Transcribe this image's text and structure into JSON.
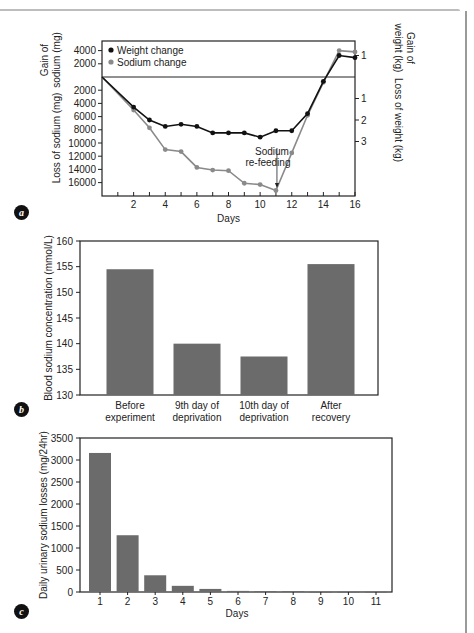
{
  "chart_data": [
    {
      "id": "a",
      "type": "line",
      "panel_label": "a",
      "title": "",
      "xlabel": "Days",
      "x_ticks": [
        2,
        4,
        6,
        8,
        10,
        12,
        14,
        16
      ],
      "xlim": [
        0,
        16
      ],
      "ylabel_left_top": "Gain of sodium (mg)",
      "ylabel_left_bottom": "Loss of sodium (mg)",
      "ylabel_right_top": "Gain of weight (kg)",
      "ylabel_right_bottom": "Loss of weight (kg)",
      "left_ticks_gain": [
        4000,
        2000
      ],
      "left_ticks_loss": [
        2000,
        4000,
        6000,
        8000,
        10000,
        12000,
        14000,
        16000
      ],
      "right_ticks_gain": [
        1
      ],
      "right_ticks_loss": [
        1,
        2,
        3
      ],
      "legend": [
        "Weight change",
        "Sodium change"
      ],
      "legend_position": "upper left",
      "annotation": {
        "text_line1": "Sodium",
        "text_line2": "re-feeding",
        "day": 11
      },
      "x": [
        0,
        2,
        3,
        4,
        5,
        6,
        7,
        8,
        9,
        10,
        11,
        12,
        13,
        14,
        15,
        16
      ],
      "series": [
        {
          "name": "Weight change",
          "unit": "kg (negative = loss)",
          "color": "#111111",
          "values": [
            0,
            -1.4,
            -2.0,
            -2.3,
            -2.2,
            -2.3,
            -2.6,
            -2.6,
            -2.6,
            -2.8,
            -2.5,
            -2.5,
            -1.7,
            -0.2,
            1.0,
            0.9
          ]
        },
        {
          "name": "Sodium change",
          "unit": "mg (negative = loss)",
          "color": "#8a8a8a",
          "values": [
            0,
            -5000,
            -7700,
            -11000,
            -11300,
            -13700,
            -14100,
            -14200,
            -16100,
            -16300,
            -17200,
            -11500,
            -5800,
            -800,
            4000,
            3800
          ]
        }
      ]
    },
    {
      "id": "b",
      "type": "bar",
      "panel_label": "b",
      "title": "",
      "xlabel": "",
      "ylabel": "Blood sodium concentration (mmol/L)",
      "ylim": [
        130,
        160
      ],
      "y_ticks": [
        130,
        135,
        140,
        145,
        150,
        155,
        160
      ],
      "categories": [
        {
          "line1": "Before",
          "line2": "experiment"
        },
        {
          "line1": "9th day of",
          "line2": "deprivation"
        },
        {
          "line1": "10th day of",
          "line2": "deprivation"
        },
        {
          "line1": "After",
          "line2": "recovery"
        }
      ],
      "values": [
        154.5,
        140,
        137.5,
        155.5
      ],
      "bar_color": "#6b6b6b"
    },
    {
      "id": "c",
      "type": "bar",
      "panel_label": "c",
      "title": "",
      "xlabel": "Days",
      "ylabel": "Daily urinary sodium losses (mg/24hr)",
      "ylim": [
        0,
        3500
      ],
      "y_ticks": [
        0,
        500,
        1000,
        1500,
        2000,
        2500,
        3000,
        3500
      ],
      "categories": [
        "1",
        "2",
        "3",
        "4",
        "5",
        "6",
        "7",
        "8",
        "9",
        "10",
        "11"
      ],
      "values": [
        3160,
        1290,
        380,
        140,
        70,
        25,
        20,
        20,
        5,
        5,
        5
      ],
      "bar_color": "#6b6b6b"
    }
  ]
}
